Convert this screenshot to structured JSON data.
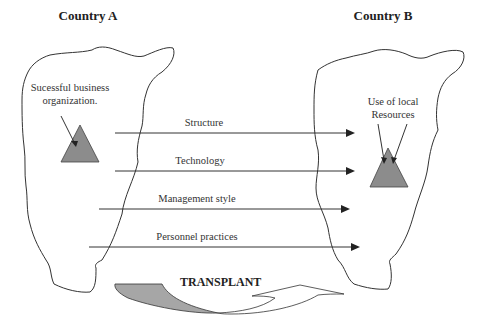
{
  "diagram": {
    "left_country": {
      "title": "Country A",
      "entity_label_line1": "Sucessful business",
      "entity_label_line2": "organization."
    },
    "right_country": {
      "title": "Country B",
      "entity_label_line1": "Use of local",
      "entity_label_line2": "Resources"
    },
    "transfers": [
      {
        "label": "Structure"
      },
      {
        "label": "Technology"
      },
      {
        "label": "Management style"
      },
      {
        "label": "Personnel practices"
      }
    ],
    "process_label": "TRANSPLANT",
    "colors": {
      "triangle_fill": "#8c8c8c",
      "arrow_fill": "#a6a6a6",
      "line": "#333333"
    }
  }
}
